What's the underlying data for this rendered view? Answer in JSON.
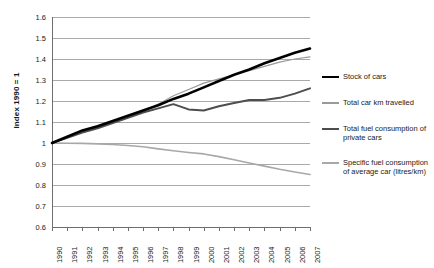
{
  "chart": {
    "type": "line",
    "title": "",
    "xlabel": "",
    "ylabel": "Index 1990 = 1"
  },
  "axis": {
    "y_title": "Index 1990 = 1",
    "y_ticks": [
      "1.6",
      "1.5",
      "1.4",
      "1.3",
      "1.2",
      "1.1",
      "1",
      "0.9",
      "0.8",
      "0.7",
      "0.6"
    ],
    "x_ticks": [
      "1990",
      "1991",
      "1992",
      "1993",
      "1994",
      "1995",
      "1996",
      "1997",
      "1998",
      "1999",
      "2000",
      "2001",
      "2002",
      "2003",
      "2004",
      "2005",
      "2006",
      "2007"
    ]
  },
  "legend": {
    "items": [
      {
        "label": "Stock of cars",
        "color": "#000000",
        "width": 2.6
      },
      {
        "label": "Total car km travelled",
        "color": "#9a9a9a",
        "width": 1.2
      },
      {
        "label": "Total fuel consumption of private cars",
        "color": "#4d4d4d",
        "width": 2.0
      },
      {
        "label": "Specific fuel consumption of average car (litres/km)",
        "color": "#a8a8a8",
        "width": 1.6
      }
    ]
  },
  "chart_data": {
    "type": "line",
    "title": "",
    "xlabel": "",
    "ylabel": "Index 1990 = 1",
    "ylim": [
      0.6,
      1.6
    ],
    "ytick_step": 0.1,
    "grid": true,
    "legend_position": "right",
    "categories": [
      "1990",
      "1991",
      "1992",
      "1993",
      "1994",
      "1995",
      "1996",
      "1997",
      "1998",
      "1999",
      "2000",
      "2001",
      "2002",
      "2003",
      "2004",
      "2005",
      "2006",
      "2007"
    ],
    "series": [
      {
        "name": "Stock of cars",
        "color": "#000000",
        "values": [
          1.0,
          1.03,
          1.06,
          1.08,
          1.105,
          1.13,
          1.155,
          1.18,
          1.21,
          1.235,
          1.265,
          1.295,
          1.325,
          1.35,
          1.38,
          1.405,
          1.43,
          1.45
        ]
      },
      {
        "name": "Total car km travelled",
        "color": "#9a9a9a",
        "values": [
          1.0,
          1.03,
          1.055,
          1.075,
          1.1,
          1.125,
          1.15,
          1.185,
          1.225,
          1.255,
          1.285,
          1.305,
          1.325,
          1.345,
          1.365,
          1.385,
          1.4,
          1.41
        ]
      },
      {
        "name": "Total fuel consumption of private cars",
        "color": "#4d4d4d",
        "values": [
          1.0,
          1.025,
          1.05,
          1.07,
          1.095,
          1.12,
          1.145,
          1.165,
          1.185,
          1.16,
          1.155,
          1.175,
          1.19,
          1.205,
          1.205,
          1.215,
          1.235,
          1.26
        ]
      },
      {
        "name": "Specific fuel consumption of average car (litres/km)",
        "color": "#a8a8a8",
        "values": [
          1.0,
          0.999,
          0.998,
          0.996,
          0.993,
          0.988,
          0.982,
          0.972,
          0.963,
          0.955,
          0.948,
          0.935,
          0.92,
          0.905,
          0.89,
          0.875,
          0.862,
          0.85
        ]
      }
    ]
  }
}
